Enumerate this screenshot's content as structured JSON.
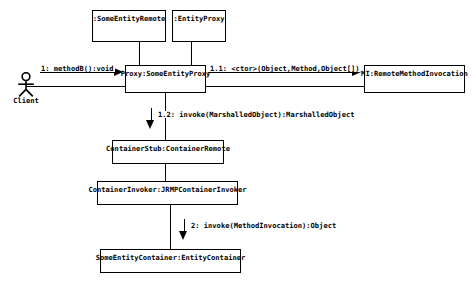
{
  "diagram": {
    "type": "uml-collaboration-diagram",
    "background_color": "#ffffff",
    "line_color": "#000000",
    "text_color": "#000000",
    "actor": {
      "name": "Client",
      "icon": "stick-figure-actor-icon"
    },
    "objects": [
      {
        "id": "some-entity-remote",
        "label": ":SomeEntityRemote"
      },
      {
        "id": "entity-proxy",
        "label": ":EntityProxy"
      },
      {
        "id": "proxy-some-entity-proxy",
        "label": "Proxy:SomeEntityProxy"
      },
      {
        "id": "remote-method-invocation",
        "label": "MI:RemoteMethodInvocation"
      },
      {
        "id": "container-stub",
        "label": "ContainerStub:ContainerRemote"
      },
      {
        "id": "container-invoker",
        "label": "ContainerInvoker:JRMPContainerInvoker"
      },
      {
        "id": "some-entity-container",
        "label": "SomeEntityContainer:EntityContainer"
      }
    ],
    "messages": [
      {
        "id": "msg-1",
        "label": "1: methodB():void"
      },
      {
        "id": "msg-1-1",
        "label": "1.1: <ctor>(Object,Method,Object[])"
      },
      {
        "id": "msg-1-2",
        "label": "1.2: invoke(MarshalledObject):MarshalledObject"
      },
      {
        "id": "msg-2",
        "label": "2: invoke(MethodInvocation):Object"
      }
    ]
  }
}
